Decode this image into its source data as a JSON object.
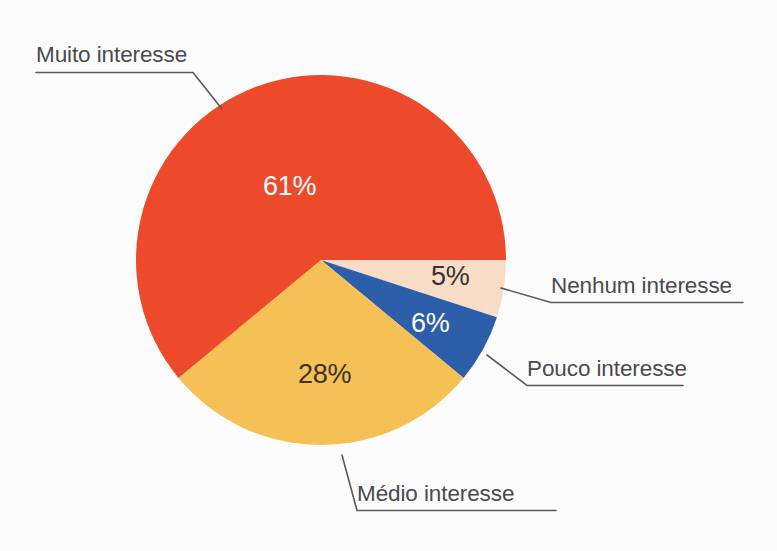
{
  "chart_data": {
    "type": "pie",
    "title": "",
    "subtitle": "",
    "xlabel": "",
    "ylabel": "",
    "legend_position": "callout-labels",
    "grid": false,
    "units": "percent",
    "total": 100,
    "start_angle_deg": 0,
    "direction": "clockwise",
    "categories": [
      "Nenhum interesse",
      "Pouco interesse",
      "Médio interesse",
      "Muito interesse"
    ],
    "values": [
      5,
      6,
      28,
      61
    ],
    "value_labels": [
      "5%",
      "6%",
      "28%",
      "61%"
    ],
    "colors": [
      "#fbdfc8",
      "#2e5fac",
      "#f8c255",
      "#ef4b2c"
    ],
    "slices": [
      {
        "label": "Nenhum interesse",
        "value": 5,
        "value_label": "5%",
        "color": "#fbdfc8",
        "label_text_color": "#3a3330"
      },
      {
        "label": "Pouco interesse",
        "value": 6,
        "value_label": "6%",
        "color": "#2e5fac",
        "label_text_color": "#ffffff"
      },
      {
        "label": "Médio interesse",
        "value": 28,
        "value_label": "28%",
        "color": "#f8c255",
        "label_text_color": "#3a3330"
      },
      {
        "label": "Muito interesse",
        "value": 61,
        "value_label": "61%",
        "color": "#ef4b2c",
        "label_text_color": "#ffffff"
      }
    ]
  },
  "figure": {
    "background_color": "#ffffff",
    "leader_line_color": "#5a5a5c",
    "label_text_color": "#4b4b4d"
  },
  "slice_values": {
    "muito": "61%",
    "medio": "28%",
    "pouco": "6%",
    "nenhum": "5%"
  },
  "callouts": {
    "muito": "Muito interesse",
    "nenhum": "Nenhum interesse",
    "pouco": "Pouco interesse",
    "medio": "Médio interesse"
  }
}
